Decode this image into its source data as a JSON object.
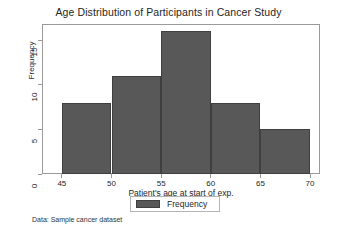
{
  "chart_data": {
    "type": "bar",
    "title": "Age Distribution of Participants in Cancer Study",
    "xlabel": "Patient's age at start of exp.",
    "ylabel": "Frequency",
    "categories": [
      "45-50",
      "50-55",
      "55-60",
      "60-65",
      "65-70"
    ],
    "bin_edges": [
      45,
      50,
      55,
      60,
      65,
      70
    ],
    "values": [
      8,
      11,
      16,
      8,
      5
    ],
    "series": [
      {
        "name": "Frequency",
        "values": [
          8,
          11,
          16,
          8,
          5
        ]
      }
    ],
    "xlim": [
      43,
      71
    ],
    "ylim": [
      0,
      16.8
    ],
    "xticks": [
      "45",
      "50",
      "55",
      "60",
      "65",
      "70"
    ],
    "xtick_values": [
      45,
      50,
      55,
      60,
      65,
      70
    ],
    "yticks": [
      "0",
      "5",
      "10",
      "15"
    ],
    "ytick_values": [
      0,
      5,
      10,
      15
    ],
    "grid": false,
    "legend_position": "below-center",
    "legend_entries": [
      "Frequency"
    ],
    "bar_color": "#585858",
    "bar_edge_color": "#3f3f3f",
    "frame_color": "#9a9a9a",
    "background": "#ffffff",
    "annotation": "Data:  Sample cancer dataset"
  }
}
